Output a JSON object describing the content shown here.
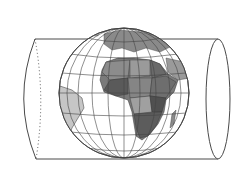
{
  "diagram": {
    "title": "",
    "elements": {
      "cylinder": {
        "stroke": "#4a4a4a",
        "back_edge_style": "dotted"
      },
      "globe": {
        "center_region": "Africa",
        "graticule": true,
        "ocean": "#ffffff",
        "land_shades": [
          "#5a5a5a",
          "#6e6e6e",
          "#828282",
          "#969696",
          "#b4b4b4",
          "#c8c8c8"
        ]
      }
    },
    "labels": []
  }
}
